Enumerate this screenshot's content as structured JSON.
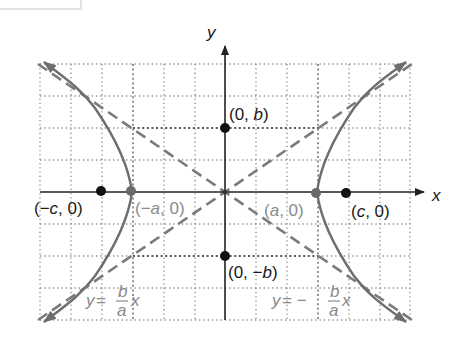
{
  "figure": {
    "axes": {
      "x_label": "x",
      "y_label": "y"
    },
    "points": {
      "co_vertex_top": {
        "label_open": "(0, ",
        "label_var": "b",
        "label_close": ")"
      },
      "co_vertex_bottom": {
        "label_open": "(0, −",
        "label_var": "b",
        "label_close": ")"
      },
      "focus_left": {
        "label_open": "(−",
        "label_var": "c",
        "label_close": ", 0)"
      },
      "focus_right": {
        "label_open": "(",
        "label_var": "c",
        "label_close": ", 0)"
      },
      "vertex_left": {
        "label_open": "(−",
        "label_var": "a",
        "label_close": ", 0)"
      },
      "vertex_right": {
        "label_open": "(",
        "label_var": "a",
        "label_close": ", 0)"
      }
    },
    "asymptotes": {
      "positive": {
        "lhs": "y",
        "eq": " = ",
        "num": "b",
        "den": "a",
        "var": "x"
      },
      "negative": {
        "lhs": "y",
        "eq": " = −",
        "num": "b",
        "den": "a",
        "var": "x"
      }
    },
    "colors": {
      "axis": "#222222",
      "curve": "#6e6e6e",
      "asymptote": "#7a7a7a",
      "grid": "#8c8c8c",
      "focus_dot": "#111111",
      "vertex_dot": "#6a6a6a"
    }
  }
}
